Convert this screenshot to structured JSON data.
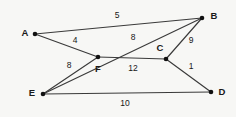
{
  "figure": {
    "background_color": "#f7f7f5",
    "edge_color": "#3a3a3a",
    "vertex_color": "#111111",
    "text_color": "#161616",
    "width": 236,
    "height": 117
  },
  "chart_data": {
    "type": "diagram",
    "subtype": "weighted-graph",
    "title": "",
    "directed": false,
    "nodes": [
      {
        "id": "A",
        "label": "A",
        "x": 35,
        "y": 34,
        "label_x": 25,
        "label_y": 33
      },
      {
        "id": "B",
        "label": "B",
        "x": 202,
        "y": 18,
        "label_x": 214,
        "label_y": 16
      },
      {
        "id": "C",
        "label": "C",
        "x": 166,
        "y": 59,
        "label_x": 160,
        "label_y": 48
      },
      {
        "id": "D",
        "label": "D",
        "x": 211,
        "y": 92,
        "label_x": 222,
        "label_y": 92
      },
      {
        "id": "E",
        "label": "E",
        "x": 43,
        "y": 94,
        "label_x": 32,
        "label_y": 93
      },
      {
        "id": "F",
        "label": "F",
        "x": 98,
        "y": 57,
        "label_x": 98,
        "label_y": 69
      }
    ],
    "edges": [
      {
        "id": "AB",
        "source": "A",
        "target": "B",
        "weight": 5,
        "label": "5",
        "label_x": 117,
        "label_y": 16
      },
      {
        "id": "AF",
        "source": "A",
        "target": "F",
        "weight": 4,
        "label": "4",
        "label_x": 75,
        "label_y": 41
      },
      {
        "id": "EB",
        "source": "E",
        "target": "B",
        "weight": 8,
        "label": "8",
        "label_x": 133,
        "label_y": 38
      },
      {
        "id": "EF",
        "source": "E",
        "target": "F",
        "weight": 8,
        "label": "8",
        "label_x": 69,
        "label_y": 66
      },
      {
        "id": "FC",
        "source": "F",
        "target": "C",
        "weight": 12,
        "label": "12",
        "label_x": 133,
        "label_y": 69
      },
      {
        "id": "CB",
        "source": "C",
        "target": "B",
        "weight": 9,
        "label": "9",
        "label_x": 191,
        "label_y": 41
      },
      {
        "id": "CD",
        "source": "C",
        "target": "D",
        "weight": 1,
        "label": "1",
        "label_x": 191,
        "label_y": 67
      },
      {
        "id": "ED",
        "source": "E",
        "target": "D",
        "weight": 10,
        "label": "10",
        "label_x": 125,
        "label_y": 104
      }
    ]
  }
}
